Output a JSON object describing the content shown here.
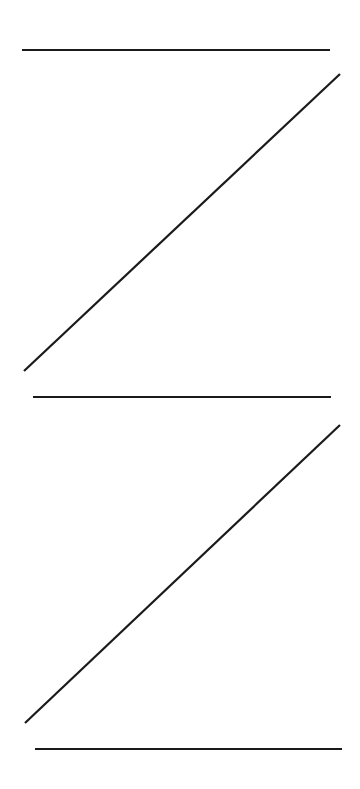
{
  "canvas": {
    "width": 360,
    "height": 789,
    "background": "#ffffff"
  },
  "stroke": {
    "color": "#1a1a1a",
    "width": 2.2
  },
  "shapes": [
    {
      "name": "top-horizontal-line",
      "x1": 22,
      "y1": 50,
      "x2": 330,
      "y2": 50
    },
    {
      "name": "upper-diagonal-line",
      "x1": 340,
      "y1": 74,
      "x2": 24,
      "y2": 371
    },
    {
      "name": "middle-horizontal-line",
      "x1": 33,
      "y1": 397,
      "x2": 331,
      "y2": 397
    },
    {
      "name": "lower-diagonal-line",
      "x1": 340,
      "y1": 425,
      "x2": 25,
      "y2": 723
    },
    {
      "name": "bottom-horizontal-line",
      "x1": 35,
      "y1": 749,
      "x2": 342,
      "y2": 749
    }
  ]
}
